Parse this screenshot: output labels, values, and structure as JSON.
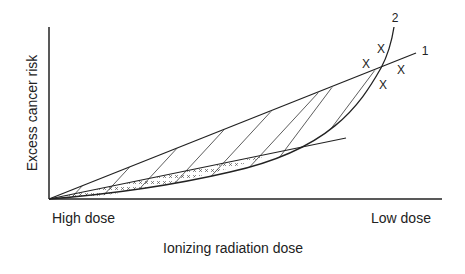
{
  "diagram": {
    "y_axis_label": "Excess cancer risk",
    "x_axis_label": "Ionizing radiation dose",
    "x_left_label": "High dose",
    "x_right_label": "Low dose",
    "curve_labels": {
      "line_1": "1",
      "curve_2": "2"
    },
    "markers": [
      "X",
      "X",
      "X",
      "X"
    ],
    "colors": {
      "stroke": "#222222",
      "background": "#ffffff"
    }
  }
}
